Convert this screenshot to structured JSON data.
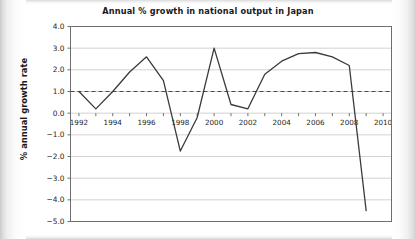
{
  "chart_data": {
    "type": "line",
    "title": "Annual % growth in national output in Japan",
    "xlabel": "",
    "ylabel": "% annual growth rate",
    "xlim": [
      1991.5,
      2010.5
    ],
    "ylim": [
      -5.0,
      4.0
    ],
    "grid": true,
    "legend": "none",
    "x": [
      1992,
      1993,
      1994,
      1995,
      1996,
      1997,
      1998,
      1999,
      2000,
      2001,
      2002,
      2003,
      2004,
      2005,
      2006,
      2007,
      2008,
      2009
    ],
    "values": [
      1.0,
      0.2,
      1.0,
      1.9,
      2.6,
      1.5,
      -1.75,
      -0.2,
      3.0,
      0.4,
      0.2,
      1.8,
      2.4,
      2.75,
      2.8,
      2.6,
      2.2,
      -4.5
    ],
    "series": [
      {
        "name": "Annual % growth rate",
        "values": [
          1.0,
          0.2,
          1.0,
          1.9,
          2.6,
          1.5,
          -1.75,
          -0.2,
          3.0,
          0.4,
          0.2,
          1.8,
          2.4,
          2.75,
          2.8,
          2.6,
          2.2,
          -4.5
        ]
      }
    ],
    "yticks": [
      4.0,
      3.0,
      2.0,
      1.0,
      0.0,
      -1.0,
      -2.0,
      -3.0,
      -4.0,
      -5.0
    ],
    "ytick_labels": [
      "4.0",
      "3.0",
      "2.0",
      "1.0",
      "0.0",
      "−1.0",
      "−2.0",
      "−3.0",
      "−4.0",
      "−5.0"
    ],
    "xticks_major": [
      1992,
      1994,
      1996,
      1998,
      2000,
      2002,
      2004,
      2006,
      2008,
      2010
    ],
    "xtick_labels": [
      "1992",
      "1994",
      "1996",
      "1998",
      "2000",
      "2002",
      "2004",
      "2006",
      "2008",
      "2010"
    ],
    "xticks_minor": [
      1993,
      1995,
      1997,
      1999,
      2001,
      2003,
      2005,
      2007,
      2009
    ],
    "annotations": [
      {
        "name": "reference-line",
        "type": "horizontal-dashed-line",
        "value": 1.0,
        "style": "dashed"
      }
    ],
    "colors": {
      "line": "#3b3b3b",
      "reference_line": "#4a4a4a",
      "grid": "#d2d2d2",
      "axis": "#6e6e6e",
      "text": "#1a1a1a",
      "background": "#ffffff"
    }
  }
}
